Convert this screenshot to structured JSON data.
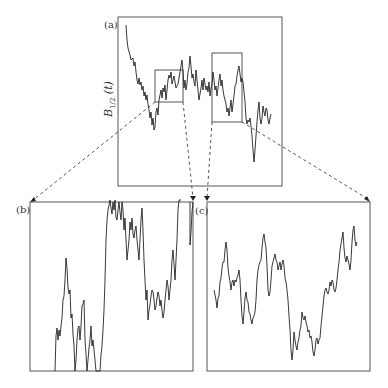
{
  "figure": {
    "panels": [
      {
        "id": "a",
        "label": "(a)",
        "ylabel_main": "B",
        "ylabel_sub": "1/2",
        "ylabel_arg": "(t)"
      },
      {
        "id": "b",
        "label": "(b)"
      },
      {
        "id": "c",
        "label": "(c)"
      }
    ]
  }
}
